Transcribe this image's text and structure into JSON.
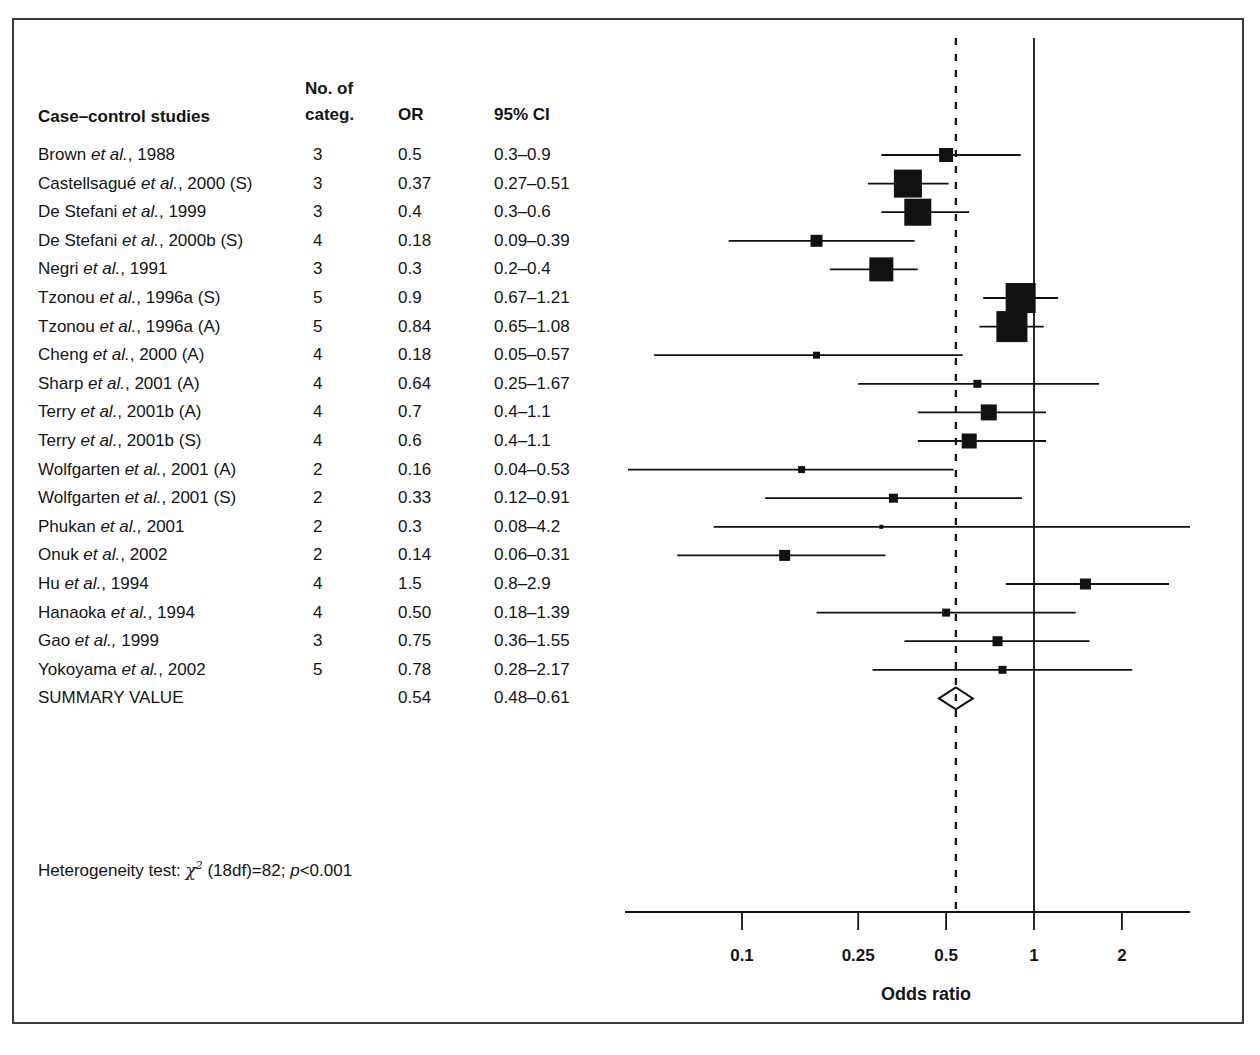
{
  "figure": {
    "kind": "forest-plot",
    "section_label": "Case–control studies"
  },
  "table_headers": {
    "study": "Case–control studies",
    "categories_line1": "No. of",
    "categories_line2": "categ.",
    "or": "OR",
    "ci": "95% CI"
  },
  "heterogeneity": {
    "prefix": "Heterogeneity test:",
    "chi": "χ",
    "sup": "2",
    "df": "(18df)=82;",
    "p_italic": "p",
    "p_rest": "<0.001"
  },
  "axis": {
    "title": "Odds ratio",
    "ticks": [
      "0.1",
      "0.25",
      "0.5",
      "1",
      "2"
    ],
    "tick_values": [
      0.1,
      0.25,
      0.5,
      1,
      2
    ],
    "scale": "log10",
    "reference_line": 1,
    "summary_line": 0.54
  },
  "chart_data": {
    "type": "forest",
    "title": "",
    "xlabel": "Odds ratio",
    "ylabel": "",
    "xscale": "log",
    "xlim": [
      0.06,
      3.0
    ],
    "xticks": [
      0.1,
      0.25,
      0.5,
      1,
      2
    ],
    "grid": false,
    "reference_line": 1.0,
    "summary_line": 0.54,
    "columns": [
      "Case–control studies",
      "No. of categ.",
      "OR",
      "95% CI"
    ],
    "rows": [
      {
        "study_plain": "Brown ",
        "study_italic": "et al.",
        "study_tail": ", 1988",
        "categories": "3",
        "or": "0.5",
        "ci": "0.3–0.9",
        "or_value": 0.5,
        "lcl": 0.3,
        "ucl": 0.9,
        "box": 14
      },
      {
        "study_plain": "Castellsagué ",
        "study_italic": "et al.",
        "study_tail": ", 2000 (S)",
        "categories": "3",
        "or": "0.37",
        "ci": "0.27–0.51",
        "or_value": 0.37,
        "lcl": 0.27,
        "ucl": 0.51,
        "box": 28
      },
      {
        "study_plain": "De Stefani ",
        "study_italic": "et al.",
        "study_tail": ", 1999",
        "categories": "3",
        "or": "0.4",
        "ci": "0.3–0.6",
        "or_value": 0.4,
        "lcl": 0.3,
        "ucl": 0.6,
        "box": 27
      },
      {
        "study_plain": "De Stefani ",
        "study_italic": "et al.",
        "study_tail": ", 2000b (S)",
        "categories": "4",
        "or": "0.18",
        "ci": "0.09–0.39",
        "or_value": 0.18,
        "lcl": 0.09,
        "ucl": 0.39,
        "box": 12
      },
      {
        "study_plain": "Negri ",
        "study_italic": "et al.",
        "study_tail": ", 1991",
        "categories": "3",
        "or": "0.3",
        "ci": "0.2–0.4",
        "or_value": 0.3,
        "lcl": 0.2,
        "ucl": 0.4,
        "box": 24
      },
      {
        "study_plain": "Tzonou ",
        "study_italic": "et al.",
        "study_tail": ", 1996a (S)",
        "categories": "5",
        "or": "0.9",
        "ci": "0.67–1.21",
        "or_value": 0.9,
        "lcl": 0.67,
        "ucl": 1.21,
        "box": 30
      },
      {
        "study_plain": "Tzonou ",
        "study_italic": "et al.",
        "study_tail": ", 1996a (A)",
        "categories": "5",
        "or": "0.84",
        "ci": "0.65–1.08",
        "or_value": 0.84,
        "lcl": 0.65,
        "ucl": 1.08,
        "box": 31
      },
      {
        "study_plain": "Cheng ",
        "study_italic": "et al.",
        "study_tail": ", 2000 (A)",
        "categories": "4",
        "or": "0.18",
        "ci": "0.05–0.57",
        "or_value": 0.18,
        "lcl": 0.05,
        "ucl": 0.57,
        "box": 7
      },
      {
        "study_plain": "Sharp ",
        "study_italic": "et al.",
        "study_tail": ", 2001 (A)",
        "categories": "4",
        "or": "0.64",
        "ci": "0.25–1.67",
        "or_value": 0.64,
        "lcl": 0.25,
        "ucl": 1.67,
        "box": 8
      },
      {
        "study_plain": "Terry ",
        "study_italic": "et al.",
        "study_tail": ", 2001b (A)",
        "categories": "4",
        "or": "0.7",
        "ci": "0.4–1.1",
        "or_value": 0.7,
        "lcl": 0.4,
        "ucl": 1.1,
        "box": 16
      },
      {
        "study_plain": "Terry ",
        "study_italic": "et al.",
        "study_tail": ", 2001b (S)",
        "categories": "4",
        "or": "0.6",
        "ci": "0.4–1.1",
        "or_value": 0.6,
        "lcl": 0.4,
        "ucl": 1.1,
        "box": 15
      },
      {
        "study_plain": "Wolfgarten ",
        "study_italic": "et al.",
        "study_tail": ", 2001 (A)",
        "categories": "2",
        "or": "0.16",
        "ci": "0.04–0.53",
        "or_value": 0.16,
        "lcl": 0.04,
        "ucl": 0.53,
        "box": 7
      },
      {
        "study_plain": "Wolfgarten ",
        "study_italic": "et al.",
        "study_tail": ", 2001 (S)",
        "categories": "2",
        "or": "0.33",
        "ci": "0.12–0.91",
        "or_value": 0.33,
        "lcl": 0.12,
        "ucl": 0.91,
        "box": 9
      },
      {
        "study_plain": "Phukan ",
        "study_italic": "et al.,",
        "study_tail": " 2001",
        "categories": "2",
        "or": "0.3",
        "ci": "0.08–4.2",
        "or_value": 0.3,
        "lcl": 0.08,
        "ucl": 4.2,
        "box": 4
      },
      {
        "study_plain": "Onuk ",
        "study_italic": "et al.",
        "study_tail": ", 2002",
        "categories": "2",
        "or": "0.14",
        "ci": "0.06–0.31",
        "or_value": 0.14,
        "lcl": 0.06,
        "ucl": 0.31,
        "box": 11
      },
      {
        "study_plain": "Hu ",
        "study_italic": "et al.",
        "study_tail": ", 1994",
        "categories": "4",
        "or": "1.5",
        "ci": "0.8–2.9",
        "or_value": 1.5,
        "lcl": 0.8,
        "ucl": 2.9,
        "box": 11
      },
      {
        "study_plain": "Hanaoka ",
        "study_italic": "et al.",
        "study_tail": ", 1994",
        "categories": "4",
        "or": "0.50",
        "ci": "0.18–1.39",
        "or_value": 0.5,
        "lcl": 0.18,
        "ucl": 1.39,
        "box": 8
      },
      {
        "study_plain": "Gao ",
        "study_italic": "et al.,",
        "study_tail": " 1999",
        "categories": "3",
        "or": "0.75",
        "ci": "0.36–1.55",
        "or_value": 0.75,
        "lcl": 0.36,
        "ucl": 1.55,
        "box": 10
      },
      {
        "study_plain": "Yokoyama ",
        "study_italic": "et al.",
        "study_tail": ", 2002",
        "categories": "5",
        "or": "0.78",
        "ci": "0.28–2.17",
        "or_value": 0.78,
        "lcl": 0.28,
        "ucl": 2.17,
        "box": 8
      },
      {
        "study_plain": "SUMMARY VALUE",
        "study_italic": "",
        "study_tail": "",
        "categories": "",
        "or": "0.54",
        "ci": "0.48–0.61",
        "or_value": 0.54,
        "lcl": 0.48,
        "ucl": 0.61,
        "box": 0,
        "is_summary": true
      }
    ]
  }
}
